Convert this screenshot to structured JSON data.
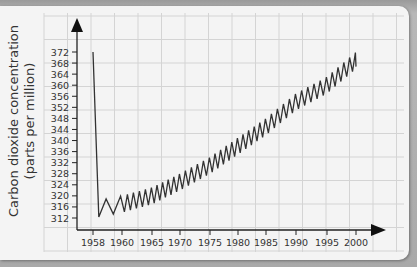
{
  "chart_data": {
    "type": "line",
    "title": "",
    "xlabel": "",
    "ylabel": "Carbon dioxide concentration (parts per million)",
    "ylabel_lines": [
      "Carbon dioxide concentration",
      "(parts per million)"
    ],
    "y_ticks": [
      312,
      316,
      320,
      324,
      328,
      332,
      336,
      340,
      344,
      348,
      352,
      356,
      360,
      364,
      368,
      372
    ],
    "x_ticks": [
      "1958",
      "1960",
      "1965",
      "1970",
      "1975",
      "1980",
      "1985",
      "1990",
      "1995",
      "2000"
    ],
    "ylim": [
      308,
      380
    ],
    "xlim": [
      1956,
      2004
    ],
    "grid": true,
    "legend": null,
    "series": [
      {
        "name": "CO2 concentration (seasonal oscillation)",
        "x": [
          1958,
          1960,
          1965,
          1970,
          1975,
          1980,
          1985,
          1990,
          1995,
          2000
        ],
        "values": [
          315,
          317,
          320,
          325,
          331,
          338,
          345,
          354,
          360,
          369
        ],
        "seasonal_amplitude_ppm": 6
      }
    ],
    "colors": {
      "line": "#333333",
      "axis": "#222222",
      "grid": "#d4d4d4",
      "background": "#f4f4f4"
    }
  }
}
